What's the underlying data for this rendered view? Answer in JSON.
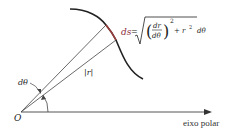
{
  "diagram": {
    "origin_label": "O",
    "axis_label": "eixo polar",
    "angle_label": "dθ",
    "radius_label": "|r|",
    "formula": {
      "lhs": "ds",
      "equals": "=",
      "numerator": "dr",
      "denominator": "dθ",
      "exponent": "2",
      "plus_term": "+ r",
      "plus_exponent": "2",
      "tail": "dθ"
    },
    "colors": {
      "curve": "#222222",
      "arc_highlight": "#9b3b3b",
      "ds_label": "#8a2a3a",
      "lines": "#444444"
    }
  }
}
